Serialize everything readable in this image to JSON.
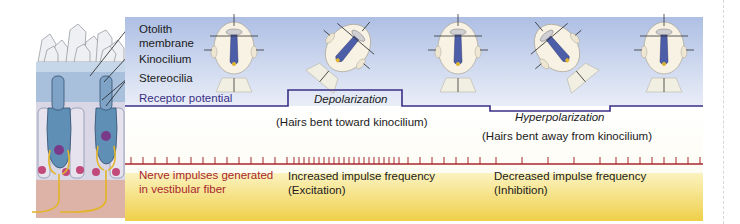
{
  "labels": {
    "otolith_line1": "Otolith",
    "otolith_line2": "membrane",
    "kinocilium": "Kinocilium",
    "stereocilia": "Stereocilia",
    "receptor_potential": "Receptor potential",
    "nerve_line1": "Nerve impulses generated",
    "nerve_line2": "in vestibular fiber"
  },
  "states": [
    {
      "name": "depolarization",
      "label": "Depolarization",
      "caption": "(Hairs bent toward kinocilium)",
      "impulse_line1": "Increased impulse frequency",
      "impulse_line2": "(Excitation)"
    },
    {
      "name": "hyperpolarization",
      "label": "Hyperpolarization",
      "caption": "(Hairs bent away from kinocilium)",
      "impulse_line1": "Decreased impulse frequency",
      "impulse_line2": "(Inhibition)"
    }
  ],
  "head_tilts": [
    "upright",
    "tilted-forward",
    "upright",
    "tilted-back",
    "upright"
  ],
  "receptor_potential_levels": [
    "resting",
    "depolarized",
    "resting",
    "hyperpolarized",
    "resting"
  ],
  "impulse_frequency": [
    "baseline",
    "increased",
    "baseline",
    "decreased",
    "baseline"
  ],
  "colors": {
    "potential_line": "#3a2f86",
    "impulse_line": "#a8262f",
    "top_band": "#b4c3e6",
    "bottom_band": "#f2d65c"
  }
}
